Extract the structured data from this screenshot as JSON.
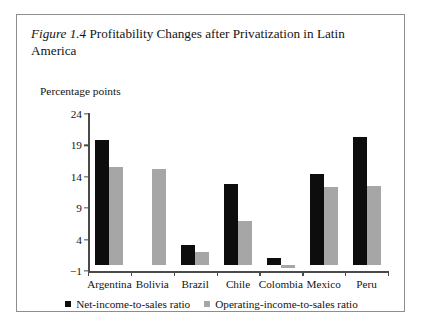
{
  "figure": {
    "number": "Figure 1.4",
    "caption": "Profitability Changes after Privatization in Latin America",
    "caption_line1": "Profitability Changes after Privatization in",
    "caption_line2": "Latin America"
  },
  "legend": {
    "net_label": "Net-income-to-sales ratio",
    "operating_label": "Operating-income-to-sales ratio",
    "net_color": "#0d0d0d",
    "operating_color": "#a6a6a6"
  },
  "chart_data": {
    "type": "bar",
    "xlabel": "",
    "ylabel": "Percentage points",
    "ylim": [
      -1,
      24
    ],
    "yticks": [
      24,
      19,
      14,
      9,
      4,
      -1
    ],
    "ytick_labels": [
      "24",
      "19",
      "14",
      "9",
      "4",
      "−1"
    ],
    "grid": false,
    "legend_position": "bottom-center",
    "categories": [
      "Argentina",
      "Bolivia",
      "Brazil",
      "Chile",
      "Colombia",
      "Mexico",
      "Peru"
    ],
    "series": [
      {
        "name": "Net-income-to-sales ratio",
        "color": "#0d0d0d",
        "values": [
          19.9,
          null,
          3.1,
          12.8,
          1.0,
          14.5,
          20.4
        ]
      },
      {
        "name": "Operating-income-to-sales ratio",
        "color": "#a6a6a6",
        "values": [
          15.5,
          15.2,
          2.0,
          7.0,
          -0.5,
          12.3,
          12.5
        ]
      }
    ]
  }
}
